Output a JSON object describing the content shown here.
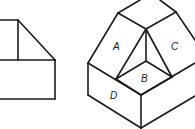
{
  "diagram": {
    "type": "technical-drawing",
    "views": [
      {
        "name": "front-orthographic-view"
      },
      {
        "name": "isometric-view"
      }
    ],
    "face_labels": {
      "A": "A",
      "B": "B",
      "C": "C",
      "D": "D"
    },
    "line_color": "#1a1a1a",
    "background": "#ffffff"
  }
}
